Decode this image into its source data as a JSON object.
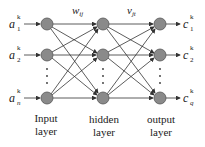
{
  "diagram": {
    "colors": {
      "node_fill": "#8a8a8a",
      "node_stroke": "#555555",
      "edge": "#333333"
    },
    "weights": {
      "input_hidden": "w",
      "input_hidden_sub": "ij",
      "hidden_output": "v",
      "hidden_output_sub": "jt"
    },
    "inputs": [
      {
        "base": "a",
        "sub": "1",
        "sup": "k"
      },
      {
        "base": "a",
        "sub": "2",
        "sup": "k"
      },
      {
        "base": "a",
        "sub": "n",
        "sup": "k"
      }
    ],
    "outputs": [
      {
        "base": "c",
        "sub": "1",
        "sup": "k"
      },
      {
        "base": "c",
        "sub": "2",
        "sup": "k"
      },
      {
        "base": "c",
        "sub": "q",
        "sup": "k"
      }
    ],
    "layers": [
      {
        "line1": "Input",
        "line2": "layer"
      },
      {
        "line1": "hidden",
        "line2": "layer"
      },
      {
        "line1": "output",
        "line2": "layer"
      }
    ]
  }
}
